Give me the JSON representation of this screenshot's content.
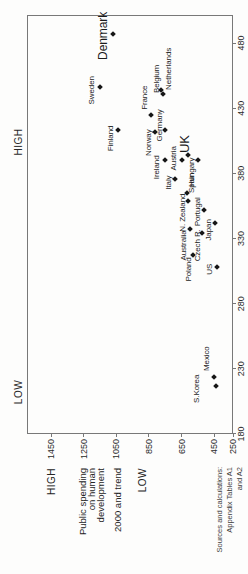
{
  "chart_data": {
    "type": "scatter",
    "title_lines": [
      "Public spending",
      "on human",
      "development",
      "2000 and trend"
    ],
    "axis_end_labels": {
      "x_low": "LOW",
      "x_high": "HIGH",
      "y_high": "HIGH",
      "y_low": "LOW"
    },
    "x_axis": {
      "ticks": [
        180,
        230,
        280,
        330,
        380,
        430,
        480
      ],
      "range": [
        180,
        501
      ],
      "grid": false
    },
    "y_axis": {
      "ticks": [
        250,
        450,
        650,
        850,
        1050,
        1250,
        1450
      ],
      "range": [
        336,
        1597
      ],
      "grid": false
    },
    "legend": null,
    "points": [
      {
        "name": "Denmark",
        "x": 487,
        "y": 1070,
        "label_dx": -2,
        "label_dy": -10,
        "font_size": 12
      },
      {
        "name": "Sweden",
        "x": 446,
        "y": 1150,
        "label_dx": -3,
        "label_dy": -8
      },
      {
        "name": "Finland",
        "x": 413,
        "y": 1040,
        "label_dx": -8,
        "label_dy": -7
      },
      {
        "name": "France",
        "x": 425,
        "y": 840,
        "label_dx": 17,
        "label_dy": -6
      },
      {
        "name": "Belgium",
        "x": 444,
        "y": 775,
        "label_dx": 11,
        "label_dy": -4
      },
      {
        "name": "Netherlands",
        "x": 441,
        "y": 765,
        "label_dx": 25,
        "label_dy": 6
      },
      {
        "name": "Norway",
        "x": 412,
        "y": 815,
        "label_dx": -11,
        "label_dy": -6
      },
      {
        "name": "Germany",
        "x": 413,
        "y": 750,
        "label_dx": 5,
        "label_dy": -5
      },
      {
        "name": "UK",
        "x": 394,
        "y": 610,
        "label_dx": 11,
        "label_dy": -3,
        "font_size": 13
      },
      {
        "name": "Austria",
        "x": 390,
        "y": 650,
        "label_dx": 2,
        "label_dy": -8
      },
      {
        "name": "Ireland",
        "x": 390,
        "y": 750,
        "label_dx": -7,
        "label_dy": -8
      },
      {
        "name": "Hungary",
        "x": 390,
        "y": 550,
        "label_dx": -12,
        "label_dy": -6
      },
      {
        "name": "Italy",
        "x": 376,
        "y": 690,
        "label_dx": -4,
        "label_dy": -6
      },
      {
        "name": "Spain",
        "x": 365,
        "y": 615,
        "label_dx": 10,
        "label_dy": 5
      },
      {
        "name": "N. Zealand",
        "x": 359,
        "y": 610,
        "label_dx": -12,
        "label_dy": -5
      },
      {
        "name": "Portugal",
        "x": 352,
        "y": 515,
        "label_dx": -2,
        "label_dy": -6
      },
      {
        "name": "Japan",
        "x": 342,
        "y": 445,
        "label_dx": -7,
        "label_dy": -6
      },
      {
        "name": "Australia",
        "x": 337,
        "y": 600,
        "label_dx": -16,
        "label_dy": -6
      },
      {
        "name": "Czech R.",
        "x": 334,
        "y": 525,
        "label_dx": -12,
        "label_dy": -4
      },
      {
        "name": "Poland",
        "x": 317,
        "y": 580,
        "label_dx": -14,
        "label_dy": -4
      },
      {
        "name": "US",
        "x": 308,
        "y": 435,
        "label_dx": -2,
        "label_dy": -7
      },
      {
        "name": "Mexico",
        "x": 224,
        "y": 450,
        "label_dx": 18,
        "label_dy": -7
      },
      {
        "name": "S.Korea",
        "x": 217,
        "y": 440,
        "label_dx": -3,
        "label_dy": -19
      }
    ]
  },
  "source_note": {
    "lines": [
      "Sources and calculations:",
      "Appendix Tables A1",
      "and A2"
    ]
  }
}
